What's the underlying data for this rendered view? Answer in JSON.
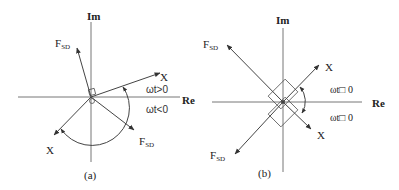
{
  "panels": [
    {
      "id": "a",
      "caption": "(a)",
      "axis_im": "Im",
      "axis_re": "Re",
      "vectors": [
        {
          "name": "F_SD upper",
          "label_main": "F",
          "label_sub": "SD"
        },
        {
          "name": "X upper",
          "label_main": "X"
        },
        {
          "name": "X lower",
          "label_main": "X"
        },
        {
          "name": "F_SD lower",
          "label_main": "F",
          "label_sub": "SD"
        }
      ],
      "region_pos": "ωt>0",
      "region_neg": "ωt<0"
    },
    {
      "id": "b",
      "caption": "(b)",
      "axis_im": "Im",
      "axis_re": "Re",
      "vectors": [
        {
          "name": "F_SD upper",
          "label_main": "F",
          "label_sub": "SD"
        },
        {
          "name": "X upper",
          "label_main": "X"
        },
        {
          "name": "F_SD lower",
          "label_main": "F",
          "label_sub": "SD"
        },
        {
          "name": "X lower",
          "label_main": "X"
        }
      ],
      "region_pos": "ωt□ 0",
      "region_neg": "ωt□ 0"
    }
  ],
  "colors": {
    "line": "#444444",
    "text": "#222222"
  }
}
